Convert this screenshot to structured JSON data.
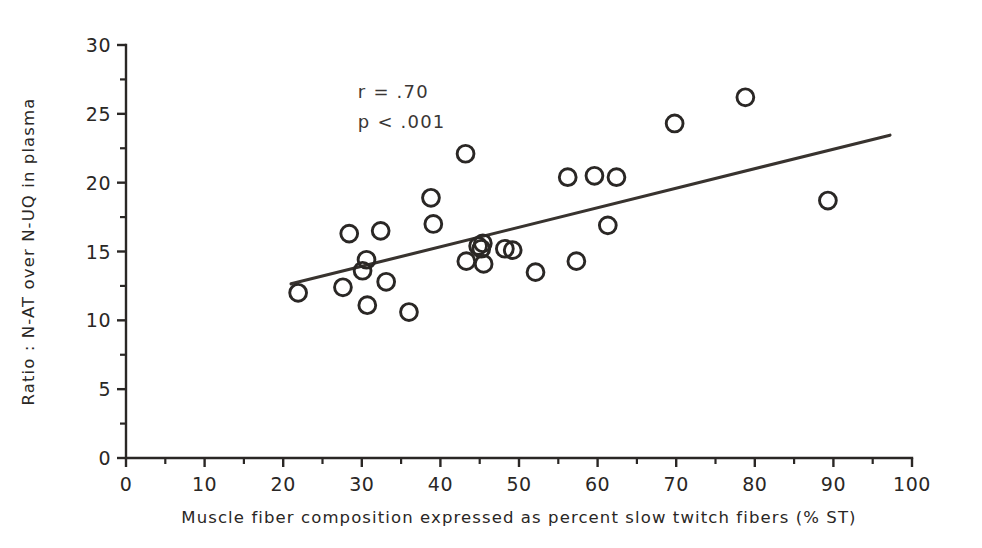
{
  "chart_data": {
    "type": "scatter",
    "title": "",
    "xlabel": "Muscle fiber composition expressed as percent slow twitch fibers (% ST)",
    "ylabel": "Ratio : N-AT over N-UQ in plasma",
    "xlim": [
      0,
      100
    ],
    "ylim": [
      0,
      30
    ],
    "grid": false,
    "legend": "none",
    "marker": "open-circle",
    "x_ticks": [
      0,
      10,
      20,
      30,
      40,
      50,
      60,
      70,
      80,
      90,
      100
    ],
    "x_tick_labels": [
      "0",
      "10",
      "20",
      "30",
      "40",
      "50",
      "60",
      "70",
      "80",
      "90",
      "100"
    ],
    "x_minor_step": 5,
    "y_ticks": [
      0,
      5,
      10,
      15,
      20,
      25,
      30
    ],
    "y_tick_labels": [
      "0",
      "5",
      "10",
      "15",
      "20",
      "25",
      "30"
    ],
    "y_minor_step": 2.5,
    "annotations": [
      {
        "id": "correlation",
        "text": "r = .70",
        "x": 29.5,
        "y": 26.6
      },
      {
        "id": "pvalue",
        "text": "p < .001",
        "x": 29.5,
        "y": 24.4
      }
    ],
    "fit_line": {
      "label": "regression line",
      "x_start": 21.0,
      "y_start": 12.65,
      "x_end": 97.2,
      "y_end": 23.45
    },
    "points": [
      {
        "x": 21.9,
        "y": 12.0
      },
      {
        "x": 27.6,
        "y": 12.4
      },
      {
        "x": 28.4,
        "y": 16.3
      },
      {
        "x": 30.1,
        "y": 13.6
      },
      {
        "x": 30.6,
        "y": 14.4
      },
      {
        "x": 30.7,
        "y": 11.1
      },
      {
        "x": 32.4,
        "y": 16.5
      },
      {
        "x": 33.1,
        "y": 12.8
      },
      {
        "x": 36.0,
        "y": 10.6
      },
      {
        "x": 38.8,
        "y": 18.9
      },
      {
        "x": 39.1,
        "y": 17.0
      },
      {
        "x": 43.2,
        "y": 22.1
      },
      {
        "x": 43.3,
        "y": 14.3
      },
      {
        "x": 44.8,
        "y": 15.4
      },
      {
        "x": 45.2,
        "y": 15.2
      },
      {
        "x": 45.4,
        "y": 15.6
      },
      {
        "x": 45.5,
        "y": 14.1
      },
      {
        "x": 48.2,
        "y": 15.2
      },
      {
        "x": 49.2,
        "y": 15.1
      },
      {
        "x": 52.1,
        "y": 13.5
      },
      {
        "x": 56.2,
        "y": 20.4
      },
      {
        "x": 57.3,
        "y": 14.3
      },
      {
        "x": 59.6,
        "y": 20.5
      },
      {
        "x": 61.3,
        "y": 16.9
      },
      {
        "x": 62.4,
        "y": 20.4
      },
      {
        "x": 69.8,
        "y": 24.3
      },
      {
        "x": 78.8,
        "y": 26.2
      },
      {
        "x": 89.3,
        "y": 18.7
      }
    ]
  },
  "colors": {
    "ink": "#2a2725",
    "line": "#38332f",
    "background": "#ffffff"
  }
}
